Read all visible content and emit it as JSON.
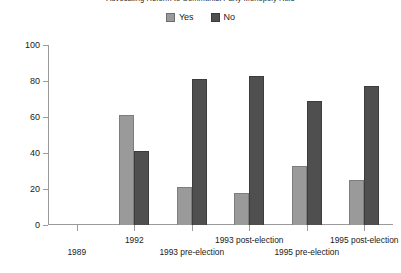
{
  "chart_data": {
    "type": "bar",
    "title": "Advocating Reform to Communist Party Monopoly Rule",
    "xlabel": "",
    "ylabel": "",
    "ylim": [
      0,
      100
    ],
    "yticks": [
      0,
      20,
      40,
      60,
      80,
      100
    ],
    "ytick_labels": [
      "0",
      "20",
      "40",
      "60",
      "80",
      "100"
    ],
    "grid": false,
    "legend_position": "top-center",
    "categories": [
      "1989",
      "1992",
      "1993 pre-election",
      "1993 post-election",
      "1995 pre-election",
      "1995 post-election"
    ],
    "category_label_rows": [
      1,
      0,
      1,
      0,
      1,
      0
    ],
    "series": [
      {
        "name": "Yes",
        "color": "#9a9a9a",
        "values": [
          null,
          61,
          21,
          18,
          33,
          25
        ]
      },
      {
        "name": "No",
        "color": "#4f4f4f",
        "values": [
          null,
          41,
          81,
          83,
          69,
          77
        ]
      }
    ]
  },
  "legend": {
    "entries": [
      {
        "label": "Yes",
        "swatch": "legend-swatch-yes"
      },
      {
        "label": "No",
        "swatch": "legend-swatch-no"
      }
    ]
  }
}
